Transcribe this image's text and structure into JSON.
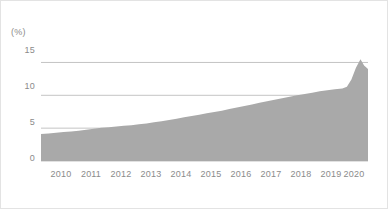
{
  "chart_data": {
    "type": "area",
    "title": "",
    "subtitle": "",
    "xlabel": "",
    "ylabel": "",
    "unit_label": "(%)",
    "xlim": [
      2010.0,
      2020.85
    ],
    "ylim": [
      0,
      17.2
    ],
    "yticks": [
      0,
      5,
      10,
      15
    ],
    "ytick_labels": [
      "0",
      "5",
      "10",
      "15"
    ],
    "xticks": [
      2010,
      2011,
      2012,
      2013,
      2014,
      2015,
      2016,
      2017,
      2018,
      2019,
      2020
    ],
    "xtick_labels": [
      "2010",
      "2011",
      "2012",
      "2013",
      "2014",
      "2015",
      "2016",
      "2017",
      "2018",
      "2019",
      "2020"
    ],
    "grid": "horizontal",
    "legend": "none",
    "series": [
      {
        "name": "share",
        "color": "#a9a9a9",
        "x": [
          2010.0,
          2010.25,
          2010.5,
          2010.75,
          2011.0,
          2011.25,
          2011.5,
          2011.75,
          2012.0,
          2012.25,
          2012.5,
          2012.75,
          2013.0,
          2013.25,
          2013.5,
          2013.75,
          2014.0,
          2014.25,
          2014.5,
          2014.75,
          2015.0,
          2015.25,
          2015.5,
          2015.75,
          2016.0,
          2016.25,
          2016.5,
          2016.75,
          2017.0,
          2017.25,
          2017.5,
          2017.75,
          2018.0,
          2018.25,
          2018.5,
          2018.75,
          2019.0,
          2019.25,
          2019.5,
          2019.75,
          2020.0,
          2020.15,
          2020.3,
          2020.45,
          2020.6,
          2020.72,
          2020.85
        ],
        "values": [
          4.1,
          4.2,
          4.3,
          4.4,
          4.5,
          4.62,
          4.75,
          4.9,
          5.05,
          5.15,
          5.25,
          5.35,
          5.45,
          5.58,
          5.72,
          5.88,
          6.05,
          6.25,
          6.45,
          6.65,
          6.85,
          7.05,
          7.25,
          7.45,
          7.65,
          7.9,
          8.15,
          8.38,
          8.6,
          8.85,
          9.1,
          9.32,
          9.55,
          9.78,
          10.0,
          10.2,
          10.4,
          10.6,
          10.78,
          10.92,
          11.05,
          11.3,
          12.4,
          14.2,
          15.5,
          14.55,
          14.0
        ]
      }
    ]
  },
  "axis": {
    "unit": "(%)",
    "y_labels": [
      "15",
      "10",
      "5",
      "0"
    ],
    "x_labels": [
      "2010",
      "2011",
      "2012",
      "2013",
      "2014",
      "2015",
      "2016",
      "2017",
      "2018",
      "2019",
      "2020"
    ]
  },
  "colors": {
    "area_fill": "#a9a9a9",
    "gridline": "#b5b5b5",
    "tick_text": "#8b8b8b",
    "frame_border": "#e3e3e3",
    "background": "#ffffff"
  }
}
